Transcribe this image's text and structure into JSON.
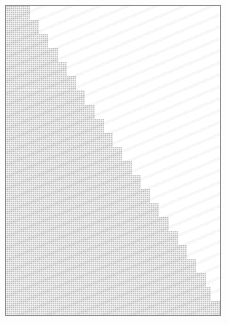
{
  "figure": {
    "title": "",
    "background_color": "#ffffff",
    "frame_color": "#8c8c8c",
    "frame_width_px": 1,
    "fill_color": "#c9c9c9",
    "fill_style": "dithered-halftone-gray",
    "width_px": 228,
    "height_px": 325
  },
  "chart_data": {
    "type": "area",
    "title": "",
    "subtitle": "",
    "xlabel": "",
    "ylabel": "",
    "xlim": [
      0,
      214
    ],
    "ylim": [
      0,
      309
    ],
    "grid": false,
    "legend": null,
    "legend_position": "none",
    "annotations": [],
    "tick_labels_x": [],
    "tick_labels_y": [],
    "series": [
      {
        "name": "staircase-wedge",
        "style": "step",
        "fill": true,
        "fill_color": "#c9c9c9",
        "description": "Monotonically increasing staircase from upper-left to lower-right; area below and left of the step edge is filled with a light gray dithered texture, area above and right is white.",
        "step_width_px": 9.2,
        "step_height_px": 14.05,
        "step_count": 22,
        "x": [
          0,
          9,
          18,
          28,
          37,
          46,
          55,
          65,
          74,
          83,
          92,
          102,
          111,
          120,
          129,
          139,
          148,
          157,
          166,
          176,
          185,
          194,
          214
        ],
        "y": [
          0,
          14,
          28,
          42,
          56,
          70,
          84,
          99,
          113,
          127,
          141,
          155,
          169,
          183,
          197,
          211,
          225,
          239,
          253,
          267,
          281,
          295,
          309
        ]
      }
    ]
  },
  "steps": [
    {
      "x": 0,
      "y": 0,
      "w": 24,
      "h": 14
    },
    {
      "x": 0,
      "y": 14,
      "w": 33,
      "h": 14
    },
    {
      "x": 0,
      "y": 28,
      "w": 42,
      "h": 14
    },
    {
      "x": 0,
      "y": 42,
      "w": 52,
      "h": 14
    },
    {
      "x": 0,
      "y": 56,
      "w": 61,
      "h": 14
    },
    {
      "x": 0,
      "y": 70,
      "w": 70,
      "h": 14
    },
    {
      "x": 0,
      "y": 84,
      "w": 79,
      "h": 15
    },
    {
      "x": 0,
      "y": 99,
      "w": 89,
      "h": 14
    },
    {
      "x": 0,
      "y": 113,
      "w": 98,
      "h": 14
    },
    {
      "x": 0,
      "y": 127,
      "w": 107,
      "h": 14
    },
    {
      "x": 0,
      "y": 141,
      "w": 116,
      "h": 14
    },
    {
      "x": 0,
      "y": 155,
      "w": 126,
      "h": 14
    },
    {
      "x": 0,
      "y": 169,
      "w": 135,
      "h": 14
    },
    {
      "x": 0,
      "y": 183,
      "w": 144,
      "h": 14
    },
    {
      "x": 0,
      "y": 197,
      "w": 153,
      "h": 14
    },
    {
      "x": 0,
      "y": 211,
      "w": 163,
      "h": 14
    },
    {
      "x": 0,
      "y": 225,
      "w": 172,
      "h": 14
    },
    {
      "x": 0,
      "y": 239,
      "w": 181,
      "h": 14
    },
    {
      "x": 0,
      "y": 253,
      "w": 190,
      "h": 14
    },
    {
      "x": 0,
      "y": 267,
      "w": 200,
      "h": 14
    },
    {
      "x": 0,
      "y": 281,
      "w": 205,
      "h": 14
    },
    {
      "x": 0,
      "y": 295,
      "w": 214,
      "h": 16
    }
  ]
}
